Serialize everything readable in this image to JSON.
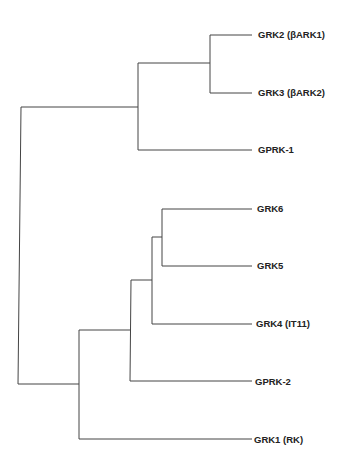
{
  "diagram": {
    "type": "phylogenetic-tree",
    "line_color": "#444444",
    "leaves": [
      {
        "id": "grk2",
        "label": "GRK2 (βARK1)",
        "x": 258,
        "y": 35
      },
      {
        "id": "grk3",
        "label": "GRK3 (βARK2)",
        "x": 258,
        "y": 93
      },
      {
        "id": "gprk1",
        "label": "GPRK-1",
        "x": 258,
        "y": 150
      },
      {
        "id": "grk6",
        "label": "GRK6",
        "x": 257,
        "y": 209
      },
      {
        "id": "grk5",
        "label": "GRK5",
        "x": 257,
        "y": 266
      },
      {
        "id": "grk4",
        "label": "GRK4 (IT11)",
        "x": 256,
        "y": 324
      },
      {
        "id": "gprk2",
        "label": "GPRK-2",
        "x": 255,
        "y": 382
      },
      {
        "id": "grk1",
        "label": "GRK1 (RK)",
        "x": 254,
        "y": 440
      }
    ],
    "edges": [
      [
        [
          252,
          35
        ],
        [
          210,
          35
        ],
        [
          210,
          93
        ],
        [
          252,
          93
        ]
      ],
      [
        [
          210,
          63
        ],
        [
          138,
          63
        ],
        [
          138,
          150
        ],
        [
          252,
          150
        ]
      ],
      [
        [
          138,
          107
        ],
        [
          21,
          107
        ],
        [
          18,
          384
        ],
        [
          79,
          384
        ]
      ],
      [
        [
          252,
          209
        ],
        [
          162,
          209
        ],
        [
          162,
          266
        ],
        [
          252,
          266
        ]
      ],
      [
        [
          162,
          237
        ],
        [
          152,
          237
        ],
        [
          152,
          324
        ],
        [
          252,
          324
        ]
      ],
      [
        [
          152,
          280
        ],
        [
          131,
          280
        ],
        [
          130,
          381
        ],
        [
          252,
          381
        ]
      ],
      [
        [
          131,
          330
        ],
        [
          79,
          330
        ],
        [
          79,
          439
        ],
        [
          252,
          439
        ]
      ]
    ]
  }
}
